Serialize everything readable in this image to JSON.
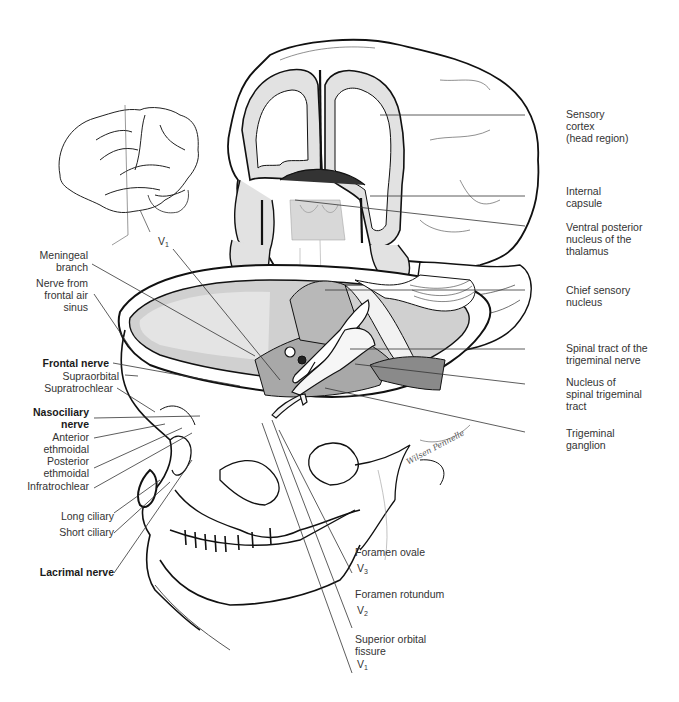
{
  "figure": {
    "colors": {
      "line": "#1a1a1a",
      "shade_dark": "#9a9a9a",
      "shade_mid": "#c4c4c4",
      "shade_light": "#e2e2e2",
      "leader": "#333333"
    }
  },
  "labels_left": [
    {
      "id": "v1_top",
      "lines": [
        "V"
      ],
      "sub": "1",
      "bold": false
    },
    {
      "id": "meningeal_branch",
      "lines": [
        "Meningeal",
        "branch"
      ],
      "bold": false
    },
    {
      "id": "nerve_frontal_sinus",
      "lines": [
        "Nerve from",
        "frontal air",
        "sinus"
      ],
      "bold": false
    },
    {
      "id": "frontal_nerve",
      "lines": [
        "Frontal nerve"
      ],
      "bold": true
    },
    {
      "id": "supraorbital",
      "lines": [
        "Supraorbital"
      ],
      "bold": false
    },
    {
      "id": "supratrochlear",
      "lines": [
        "Supratrochlear"
      ],
      "bold": false
    },
    {
      "id": "nasociliary_nerve",
      "lines": [
        "Nasociliary",
        "nerve"
      ],
      "bold": true
    },
    {
      "id": "anterior_ethmoidal",
      "lines": [
        "Anterior",
        "ethmoidal"
      ],
      "bold": false
    },
    {
      "id": "posterior_ethmoidal",
      "lines": [
        "Posterior",
        "ethmoidal"
      ],
      "bold": false
    },
    {
      "id": "infratrochlear",
      "lines": [
        "Infratrochlear"
      ],
      "bold": false
    },
    {
      "id": "long_ciliary",
      "lines": [
        "Long ciliary"
      ],
      "bold": false
    },
    {
      "id": "short_ciliary",
      "lines": [
        "Short ciliary"
      ],
      "bold": false
    },
    {
      "id": "lacrimal_nerve",
      "lines": [
        "Lacrimal nerve"
      ],
      "bold": true
    }
  ],
  "labels_right": [
    {
      "id": "sensory_cortex",
      "lines": [
        "Sensory",
        "cortex",
        "(head region)"
      ]
    },
    {
      "id": "internal_capsule",
      "lines": [
        "Internal",
        "capsule"
      ]
    },
    {
      "id": "ventral_posterior_nucleus",
      "lines": [
        "Ventral posterior",
        "nucleus of the",
        "thalamus"
      ]
    },
    {
      "id": "chief_sensory_nucleus",
      "lines": [
        "Chief sensory",
        "nucleus"
      ]
    },
    {
      "id": "spinal_tract",
      "lines": [
        "Spinal tract of the",
        "trigeminal nerve"
      ]
    },
    {
      "id": "nucleus_spinal_tract",
      "lines": [
        "Nucleus of",
        "spinal trigeminal",
        "tract"
      ]
    },
    {
      "id": "trigeminal_ganglion",
      "lines": [
        "Trigeminal",
        "ganglion"
      ]
    }
  ],
  "labels_bottom": [
    {
      "id": "foramen_ovale",
      "lines": [
        "Foramen ovale"
      ],
      "division": "V",
      "sub": "3"
    },
    {
      "id": "foramen_rotundum",
      "lines": [
        "Foramen rotundum"
      ],
      "division": "V",
      "sub": "2"
    },
    {
      "id": "superior_orbital_fissure",
      "lines": [
        "Superior orbital",
        "fissure"
      ],
      "division": "V",
      "sub": "1"
    }
  ]
}
